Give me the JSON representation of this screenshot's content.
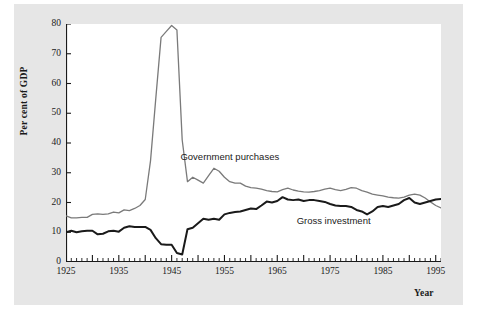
{
  "figure": {
    "background_color": "#e6e6e6",
    "plot_background_color": "#ffffff"
  },
  "chart_data": {
    "type": "line",
    "title": "",
    "xlabel": "Year",
    "ylabel": "Per cent of GDP",
    "xlim": [
      1925,
      1996
    ],
    "ylim": [
      0,
      80
    ],
    "grid": false,
    "legend_position": "inline-annotation",
    "yticks": [
      0,
      10,
      20,
      30,
      40,
      50,
      60,
      70,
      80
    ],
    "ytick_labels": [
      "0",
      "10",
      "20",
      "30",
      "40",
      "50",
      "60",
      "70",
      "80"
    ],
    "xticks": [
      1925,
      1935,
      1945,
      1955,
      1965,
      1975,
      1985,
      1995
    ],
    "xtick_labels": [
      "1925",
      "1935",
      "1945",
      "1955",
      "1965",
      "1975",
      "1985",
      "1995"
    ],
    "x_minor_tick_interval": 1,
    "x": [
      1925,
      1926,
      1927,
      1928,
      1929,
      1930,
      1931,
      1932,
      1933,
      1934,
      1935,
      1936,
      1937,
      1938,
      1939,
      1940,
      1941,
      1942,
      1943,
      1944,
      1945,
      1946,
      1947,
      1948,
      1949,
      1950,
      1951,
      1952,
      1953,
      1954,
      1955,
      1956,
      1957,
      1958,
      1959,
      1960,
      1961,
      1962,
      1963,
      1964,
      1965,
      1966,
      1967,
      1968,
      1969,
      1970,
      1971,
      1972,
      1973,
      1974,
      1975,
      1976,
      1977,
      1978,
      1979,
      1980,
      1981,
      1982,
      1983,
      1984,
      1985,
      1986,
      1987,
      1988,
      1989,
      1990,
      1991,
      1992,
      1993,
      1994,
      1995,
      1996
    ],
    "series": [
      {
        "name": "Government purchases",
        "color": "#7a7a7a",
        "line_width": 1.3,
        "label_x": 1955,
        "label_y": 35,
        "values": [
          15.5,
          14.8,
          14.8,
          15.0,
          15.0,
          16.0,
          16.2,
          16.0,
          16.2,
          16.8,
          16.5,
          17.5,
          17.3,
          18.0,
          19.0,
          21.0,
          34.0,
          55.0,
          75.5,
          77.5,
          79.5,
          78.0,
          41.0,
          27.0,
          28.5,
          27.5,
          26.5,
          29.0,
          31.5,
          30.5,
          28.5,
          27.0,
          26.5,
          26.5,
          25.5,
          25.0,
          24.8,
          24.5,
          24.0,
          23.7,
          23.6,
          24.3,
          24.8,
          24.2,
          23.8,
          23.6,
          23.5,
          23.7,
          24.0,
          24.5,
          24.8,
          24.3,
          24.0,
          24.4,
          25.0,
          24.8,
          24.0,
          23.5,
          22.8,
          22.5,
          22.2,
          21.8,
          21.6,
          21.5,
          21.8,
          22.5,
          22.8,
          22.5,
          21.5,
          20.2,
          19.0,
          18.2
        ]
      },
      {
        "name": "Gross investment",
        "color": "#1a1a1a",
        "line_width": 2.0,
        "label_x": 1977,
        "label_y": 13.5,
        "values": [
          10.0,
          10.5,
          10.0,
          10.3,
          10.5,
          10.5,
          9.3,
          9.5,
          10.3,
          10.5,
          10.2,
          11.5,
          12.0,
          11.8,
          11.8,
          11.8,
          10.8,
          8.0,
          6.0,
          5.8,
          5.8,
          3.0,
          2.5,
          11.0,
          11.5,
          13.0,
          14.5,
          14.2,
          14.5,
          14.2,
          16.0,
          16.5,
          16.8,
          17.0,
          17.5,
          18.0,
          17.8,
          19.0,
          20.3,
          20.0,
          20.5,
          21.8,
          21.0,
          20.8,
          21.0,
          20.5,
          20.8,
          20.8,
          20.5,
          20.2,
          19.5,
          19.0,
          18.8,
          18.8,
          18.5,
          17.5,
          17.0,
          16.0,
          17.0,
          18.5,
          18.8,
          18.5,
          19.0,
          19.5,
          20.8,
          21.5,
          20.0,
          19.5,
          20.0,
          20.5,
          21.0,
          21.2
        ]
      }
    ]
  }
}
